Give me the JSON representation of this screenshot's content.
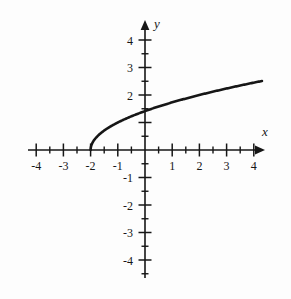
{
  "figure": {
    "background_color": "#fdfdfd",
    "ink_color": "#161616",
    "width": 291,
    "height": 299
  },
  "axes": {
    "x_axis_label": "x",
    "y_axis_label": "y",
    "x_arrow": "right-arrow",
    "y_arrow": "up-arrow"
  },
  "chart_data": {
    "type": "line",
    "title": "",
    "subtitle": "",
    "xlabel": "x",
    "ylabel": "y",
    "xlim": [
      -4.6,
      4.6
    ],
    "ylim": [
      -4.6,
      4.6
    ],
    "grid": false,
    "legend": false,
    "legend_position": "none",
    "x_ticks": [
      -4,
      -3,
      -2,
      -1,
      1,
      2,
      3,
      4
    ],
    "x_tick_labels": [
      "-4",
      "-3",
      "-2",
      "-1",
      "1",
      "2",
      "3",
      "4"
    ],
    "y_ticks": [
      -4,
      -3,
      -2,
      -1,
      1,
      2,
      3,
      4
    ],
    "y_tick_labels": [
      "-4",
      "-3",
      "-2",
      "-1",
      "",
      "2",
      "3",
      "4"
    ],
    "y_tick_labels_shown": [
      "2",
      "3",
      "4",
      "-1",
      "-2",
      "-3",
      "-4"
    ],
    "minor_ticks_x": [
      -4.5,
      -3.5,
      -2.5,
      -1.5,
      -0.5,
      0.5,
      1.5,
      2.5,
      3.5,
      4.5
    ],
    "minor_ticks_y": [
      -4.5,
      -3.5,
      -2.5,
      -1.5,
      -0.5,
      0.5,
      1.5,
      2.5,
      3.5,
      4.5
    ],
    "series": [
      {
        "name": "y = sqrt(x + 2)",
        "equation": "y = √(x + 2)",
        "domain": [
          -2,
          4.3
        ],
        "color": "#161616",
        "line_width": 2.6,
        "x": [
          -2,
          -1.95,
          -1.9,
          -1.8,
          -1.7,
          -1.6,
          -1.5,
          -1.25,
          -1,
          -0.75,
          -0.5,
          -0.25,
          0,
          0.5,
          1,
          1.5,
          2,
          2.5,
          3,
          3.5,
          4,
          4.3
        ],
        "y": [
          0,
          0.224,
          0.316,
          0.447,
          0.548,
          0.632,
          0.707,
          0.866,
          1,
          1.118,
          1.225,
          1.323,
          1.414,
          1.581,
          1.732,
          1.871,
          2,
          2.121,
          2.236,
          2.345,
          2.449,
          2.51
        ]
      }
    ],
    "key_points": [
      {
        "label": "start point (vertical tangent)",
        "x": -2,
        "y": 0
      },
      {
        "label": "y-intercept",
        "x": 0,
        "y": 1.414
      },
      {
        "label": "curve end",
        "x": 4.3,
        "y": 2.51
      }
    ]
  },
  "tick_labels": {
    "x_neg_4": "-4",
    "x_neg_3": "-3",
    "x_neg_2": "-2",
    "x_neg_1": "-1",
    "x_pos_1": "1",
    "x_pos_2": "2",
    "x_pos_3": "3",
    "x_pos_4": "4",
    "y_pos_2": "2",
    "y_pos_3": "3",
    "y_pos_4": "4",
    "y_neg_1": "-1",
    "y_neg_2": "-2",
    "y_neg_3": "-3",
    "y_neg_4": "-4"
  }
}
